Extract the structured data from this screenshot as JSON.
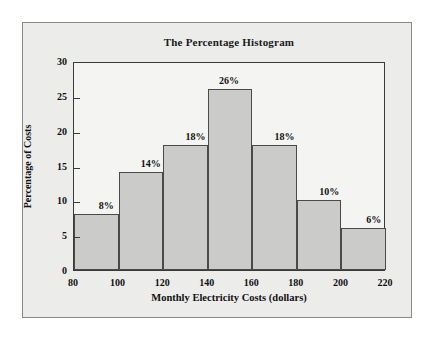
{
  "chart_data": {
    "type": "bar",
    "title": "The Percentage Histogram",
    "xlabel": "Monthly Electricity Costs (dollars)",
    "ylabel": "Percentage of Costs",
    "categories": [
      "80-100",
      "100-120",
      "120-140",
      "140-160",
      "160-180",
      "180-200",
      "200-220"
    ],
    "bin_edges": [
      80,
      100,
      120,
      140,
      160,
      180,
      200,
      220
    ],
    "values": [
      8,
      14,
      18,
      26,
      18,
      10,
      6
    ],
    "data_labels": [
      "8%",
      "14%",
      "18%",
      "26%",
      "18%",
      "10%",
      "6%"
    ],
    "xlim": [
      80,
      220
    ],
    "ylim": [
      0,
      30
    ],
    "x_ticks": [
      "80",
      "100",
      "120",
      "140",
      "160",
      "180",
      "200",
      "220"
    ],
    "x_tick_values": [
      80,
      100,
      120,
      140,
      160,
      180,
      200,
      220
    ],
    "y_ticks": [
      "0",
      "5",
      "10",
      "15",
      "20",
      "25",
      "30"
    ],
    "y_tick_values": [
      0,
      5,
      10,
      15,
      20,
      25,
      30
    ],
    "grid": false,
    "legend": null,
    "colors": {
      "bar_fill": "#cbcbc9",
      "bar_stroke": "#4a4a4a",
      "axis": "#3a3a3a",
      "text": "#111111",
      "plot_background": "#f4f4f3",
      "figure_background": "#ececeb",
      "page_background": "#ffffff"
    }
  }
}
